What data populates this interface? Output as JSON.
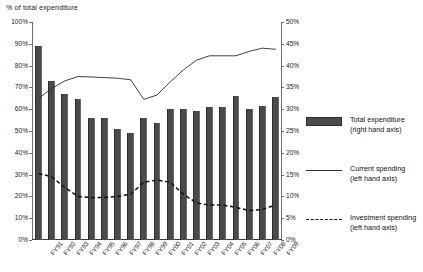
{
  "chart_data": {
    "type": "bar",
    "title": "",
    "ylabel": "% of total expenditure",
    "xlabel": "",
    "grid": false,
    "legend_position": "right",
    "categories": [
      "FY91",
      "FY92",
      "FY93",
      "FY94",
      "FY95",
      "FY96",
      "FY97",
      "FY98",
      "FY99",
      "FY00",
      "FY01",
      "FY02",
      "FY03",
      "FY04",
      "FY05",
      "FY06",
      "FY07",
      "FY08",
      "FY09"
    ],
    "axes": {
      "left": {
        "label": "% of total expenditure",
        "ylim": [
          0,
          100
        ],
        "ticks": [
          0,
          10,
          20,
          30,
          40,
          50,
          60,
          70,
          80,
          90,
          100
        ],
        "ticklabels": [
          "0%",
          "10%",
          "20%",
          "30%",
          "40%",
          "50%",
          "60%",
          "70%",
          "80%",
          "90%",
          "100%"
        ]
      },
      "right": {
        "label": "",
        "ylim": [
          0,
          50
        ],
        "ticks": [
          0,
          5,
          10,
          15,
          20,
          25,
          30,
          35,
          40,
          45,
          50
        ],
        "ticklabels": [
          "0%",
          "5%",
          "10%",
          "15%",
          "20%",
          "25%",
          "30%",
          "35%",
          "40%",
          "45%",
          "50%"
        ]
      }
    },
    "series": [
      {
        "name": "Total expenditure",
        "legend_label": "Total expenditure",
        "legend_sublabel": "(right hand axis)",
        "type": "bar",
        "axis": "right",
        "color": "#4a4a4a",
        "values": [
          44.5,
          36.5,
          33.5,
          32.3,
          28.0,
          28.0,
          25.5,
          24.5,
          28.0,
          26.8,
          30.0,
          30.0,
          29.5,
          30.5,
          30.5,
          33.0,
          30.0,
          30.8,
          32.8
        ]
      },
      {
        "name": "Current spending",
        "legend_label": "Current spending",
        "legend_sublabel": "(left hand axis)",
        "type": "line",
        "axis": "left",
        "color": "#2b2b2b",
        "values": [
          65.0,
          69.5,
          73.0,
          75.0,
          74.8,
          74.5,
          74.2,
          73.5,
          64.5,
          66.5,
          72.5,
          78.0,
          82.5,
          84.5,
          84.5,
          84.5,
          86.5,
          88.0,
          87.5
        ]
      },
      {
        "name": "Investment spending",
        "legend_label": "Investment spending",
        "legend_sublabel": "(left hand axis)",
        "type": "line-dashed",
        "axis": "left",
        "color": "#111111",
        "values": [
          30.5,
          29.0,
          24.0,
          20.0,
          19.5,
          19.5,
          20.0,
          21.0,
          26.5,
          27.5,
          26.5,
          21.0,
          17.0,
          16.0,
          16.0,
          15.0,
          13.5,
          14.0,
          16.0
        ]
      }
    ]
  },
  "legend": {
    "items": [
      {
        "label": "Total expenditure",
        "sublabel": "(right hand axis)",
        "key": "bar-swatch"
      },
      {
        "label": "Current spending",
        "sublabel": "(left hand axis)",
        "key": "solid-line-swatch"
      },
      {
        "label": "Investment spending",
        "sublabel": "(left hand axis)",
        "key": "dashed-line-swatch"
      }
    ]
  }
}
